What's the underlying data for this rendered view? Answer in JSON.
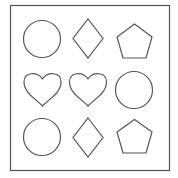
{
  "figure": {
    "stroke_color": "#555555",
    "frame_color": "#555555",
    "background": "#ffffff",
    "grid": [
      [
        "circle",
        "diamond",
        "pentagon"
      ],
      [
        "heart",
        "heart",
        "circle"
      ],
      [
        "circle",
        "diamond",
        "pentagon"
      ]
    ]
  }
}
